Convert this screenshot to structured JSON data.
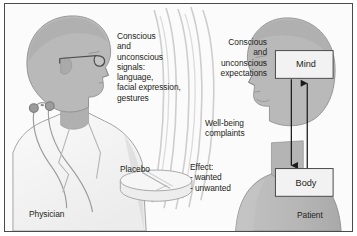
{
  "figure": {
    "background_color": "#fbfbfb",
    "border_color": "#4a4a4a",
    "text_color": "#231f20",
    "figure_fill": "#b9b9b9",
    "coat_fill": "#f4f4f4",
    "wave_color": "#c9c9c9"
  },
  "labels": {
    "signals": "Conscious\nand\nunconscious\nsignals:\nlanguage,\nfacial expression,\ngestures",
    "expectations": "Conscious\nand\nunconscious\nexpectations",
    "wellbeing": "Well-being\ncomplaints",
    "effect": "Effect:\n- wanted\n- unwanted",
    "placebo": "Placebo",
    "physician": "Physician",
    "patient": "Patient"
  },
  "boxes": {
    "mind": "Mind",
    "body": "Body"
  },
  "arrows": {
    "mind_to_body": "downward arrow from Mind to Body",
    "body_to_mind": "upward arrow from Body to Mind"
  },
  "icons": {
    "physician_figure": "physician-profile-icon",
    "patient_figure": "patient-profile-icon",
    "glasses": "eyeglasses-icon",
    "stethoscope": "stethoscope-icon",
    "placebo_pill": "placebo-tablet-icon",
    "waves": "communication-waves-icon"
  }
}
